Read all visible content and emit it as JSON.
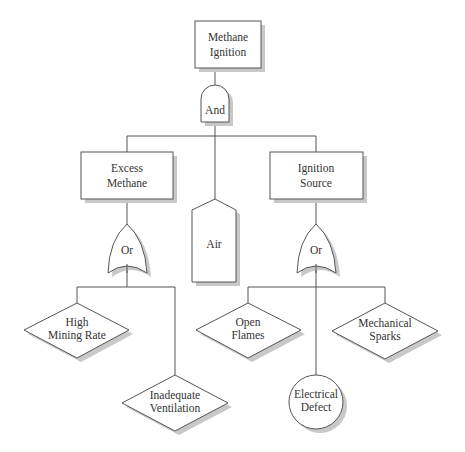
{
  "diagram": {
    "type": "fault-tree",
    "top_event": {
      "line1": "Methane",
      "line2": "Ignition"
    },
    "top_gate": {
      "label": "And",
      "type": "AND"
    },
    "intermediate_events": {
      "excess_methane": {
        "line1": "Excess",
        "line2": "Methane"
      },
      "air": {
        "label": "Air",
        "shape": "house"
      },
      "ignition_source": {
        "line1": "Ignition",
        "line2": "Source"
      }
    },
    "left_gate": {
      "label": "Or",
      "type": "OR"
    },
    "right_gate": {
      "label": "Or",
      "type": "OR"
    },
    "basic_events": {
      "high_mining_rate": {
        "line1": "High",
        "line2": "Mining Rate",
        "shape": "diamond"
      },
      "inadequate_ventilation": {
        "line1": "Inadequate",
        "line2": "Ventilation",
        "shape": "diamond"
      },
      "open_flames": {
        "line1": "Open",
        "line2": "Flames",
        "shape": "diamond"
      },
      "mechanical_sparks": {
        "line1": "Mechanical",
        "line2": "Sparks",
        "shape": "diamond"
      },
      "electrical_defect": {
        "line1": "Electrical",
        "line2": "Defect",
        "shape": "circle"
      }
    },
    "colors": {
      "stroke": "#555555",
      "fill": "#ffffff",
      "shadow": "#c8c8c8",
      "text": "#333333"
    }
  }
}
